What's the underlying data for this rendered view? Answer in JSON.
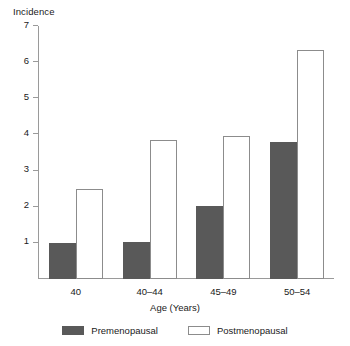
{
  "chart_data": {
    "type": "bar",
    "title": "",
    "xlabel": "Age (Years)",
    "ylabel": "Incidence",
    "categories": [
      "40",
      "40–44",
      "45–49",
      "50–54"
    ],
    "series": [
      {
        "name": "Premenopausal",
        "values": [
          1.0,
          1.02,
          2.03,
          3.78
        ],
        "color": "#595959"
      },
      {
        "name": "Postmenopausal",
        "values": [
          2.48,
          3.84,
          3.96,
          6.35
        ],
        "color": "#ffffff"
      }
    ],
    "ylim": [
      0,
      7
    ],
    "yticks": [
      1,
      2,
      3,
      4,
      5,
      6,
      7
    ],
    "ytick_labels": [
      "1",
      "2",
      "3",
      "4",
      "5",
      "6",
      "7"
    ],
    "grid": false,
    "legend_position": "bottom"
  },
  "legend": {
    "items": [
      {
        "label": "Premenopausal",
        "swatch": "filled-gray"
      },
      {
        "label": "Postmenopausal",
        "swatch": "outlined-white"
      }
    ]
  }
}
